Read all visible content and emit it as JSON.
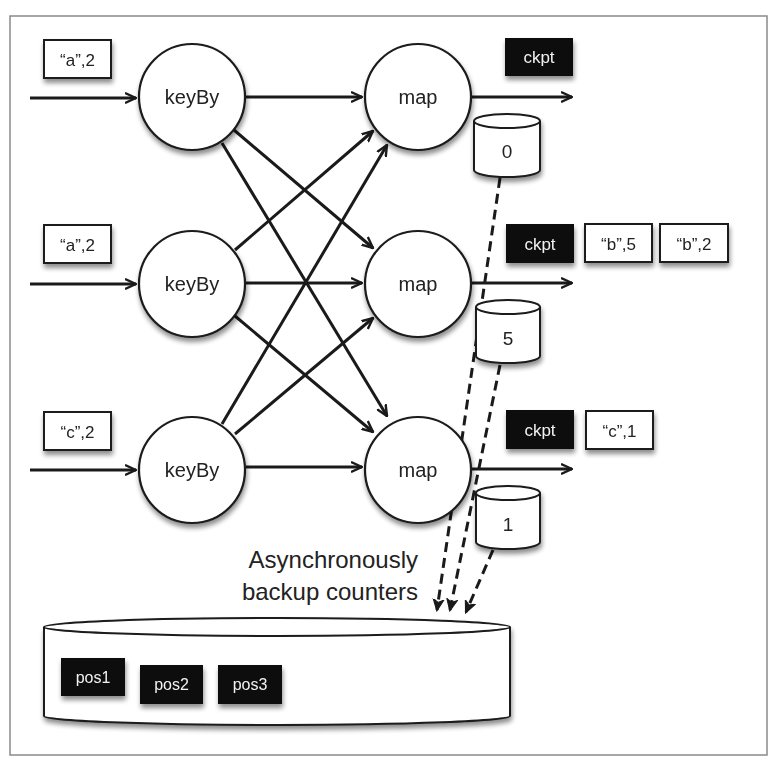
{
  "diagram": {
    "inputs": [
      {
        "label": "“a”,2"
      },
      {
        "label": "“a”,2"
      },
      {
        "label": "“c”,2"
      }
    ],
    "keyby_nodes": [
      {
        "label": "keyBy"
      },
      {
        "label": "keyBy"
      },
      {
        "label": "keyBy"
      }
    ],
    "map_nodes": [
      {
        "label": "map"
      },
      {
        "label": "map"
      },
      {
        "label": "map"
      }
    ],
    "counters": [
      {
        "value": "0"
      },
      {
        "value": "5"
      },
      {
        "value": "1"
      }
    ],
    "outputs": [
      {
        "ckpt": "ckpt",
        "records": []
      },
      {
        "ckpt": "ckpt",
        "records": [
          "“b”,5",
          "“b”,2"
        ]
      },
      {
        "ckpt": "ckpt",
        "records": [
          "“c”,1"
        ]
      }
    ],
    "backup_caption_line1": "Asynchronously",
    "backup_caption_line2": "backup counters",
    "storage_positions": [
      "pos1",
      "pos2",
      "pos3"
    ],
    "colors": {
      "stroke": "#1a1a1a",
      "dark_box": "#0d0d0d",
      "background": "#ffffff",
      "frame": "#8a8a8a"
    }
  }
}
